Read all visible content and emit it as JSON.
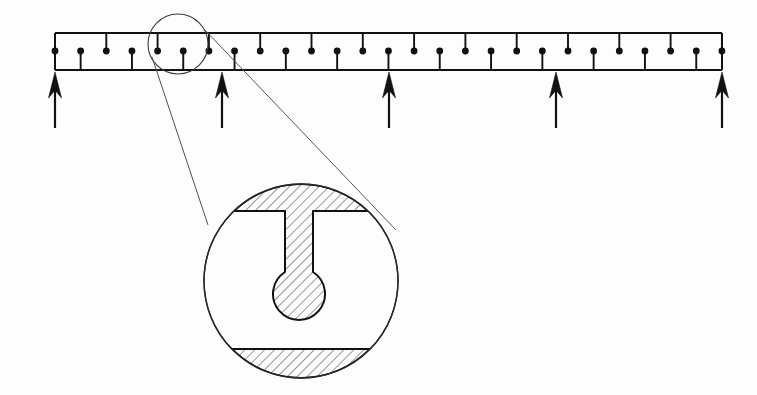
{
  "figure": {
    "kind": "engineering-section-detail-drawing",
    "background_color": "#fdfdfd",
    "line_color": "#111111"
  },
  "beam": {
    "name": "continuous-beam",
    "top_rail_y": 33,
    "bottom_rail_y": 70,
    "left_x": 55,
    "right_x": 722,
    "stroke_width": 2.0,
    "node_count": 27,
    "node_spacing": 25.65,
    "node_radius": 3.4,
    "node_center_y": 51,
    "stem_pattern": [
      "up",
      "down"
    ],
    "stem_up_label": "stiffener-up",
    "stem_down_label": "stiffener-down"
  },
  "supports": {
    "name": "support-reactions",
    "count": 5,
    "x_positions": [
      55,
      222,
      389,
      556,
      722
    ],
    "shaft_bottom_y": 128,
    "head_top_y": 72,
    "head_height": 26,
    "head_half_width": 6.5,
    "shaft_width": 2.2,
    "direction": "up"
  },
  "detail_marker": {
    "name": "detail-callout-circle",
    "center_x": 178,
    "center_y": 44,
    "radius": 30
  },
  "detail_view": {
    "name": "enlarged-section-view",
    "center_x": 301,
    "center_y": 281,
    "radius": 97,
    "leaders": [
      {
        "x1": 152,
        "y1": 57,
        "x2": 208,
        "y2": 225
      },
      {
        "x1": 203,
        "y1": 28,
        "x2": 396,
        "y2": 230
      }
    ],
    "top_flange": {
      "name": "top-flange",
      "chord_y": 211,
      "hatched": true
    },
    "web": {
      "name": "web-stem",
      "half_width": 14,
      "top_y": 211,
      "bottom_y": 272
    },
    "bulb": {
      "name": "bulb-head",
      "center_x": 299,
      "center_y": 289,
      "radius": 26,
      "hatched": true
    },
    "bottom_flange": {
      "name": "bottom-flange",
      "chord_y": 349,
      "hatched": true
    },
    "hatch": {
      "angle_deg": 45,
      "spacing": 7,
      "stroke_width": 0.9,
      "color": "#1a1a1a"
    }
  }
}
